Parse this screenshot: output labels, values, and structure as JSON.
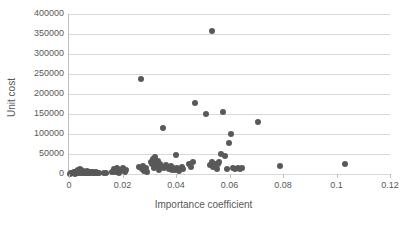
{
  "chart_data": {
    "type": "scatter",
    "title": "",
    "xlabel": "Importance coefficient",
    "ylabel": "Unit cost",
    "xlim": [
      0,
      0.12
    ],
    "ylim": [
      0,
      400000
    ],
    "xticks": [
      "0",
      "0.02",
      "0.04",
      "0.06",
      "0.08",
      "0.1",
      "0.12"
    ],
    "xtick_values": [
      0,
      0.02,
      0.04,
      0.06,
      0.08,
      0.1,
      0.12
    ],
    "yticks": [
      "0",
      "50000",
      "100000",
      "150000",
      "200000",
      "250000",
      "300000",
      "350000",
      "400000"
    ],
    "ytick_values": [
      0,
      50000,
      100000,
      150000,
      200000,
      250000,
      300000,
      350000,
      400000
    ],
    "grid": "horizontal",
    "legend": "none",
    "marker_color": "#595959",
    "gridline_color": "#d9d9d9",
    "axis_color": "#bfbfbf",
    "series": [
      {
        "name": "Items",
        "points": [
          [
            0.0005,
            1000
          ],
          [
            0.0008,
            2500
          ],
          [
            0.0011,
            1500
          ],
          [
            0.0013,
            3000
          ],
          [
            0.0016,
            2000
          ],
          [
            0.0018,
            5000
          ],
          [
            0.0021,
            1000
          ],
          [
            0.0024,
            4000
          ],
          [
            0.0026,
            2500
          ],
          [
            0.0029,
            8000
          ],
          [
            0.0031,
            3500
          ],
          [
            0.0034,
            11000
          ],
          [
            0.0036,
            2000
          ],
          [
            0.0039,
            6000
          ],
          [
            0.0041,
            13000
          ],
          [
            0.0043,
            3000
          ],
          [
            0.0046,
            9000
          ],
          [
            0.0049,
            4500
          ],
          [
            0.0051,
            2000
          ],
          [
            0.0054,
            7000
          ],
          [
            0.0057,
            3000
          ],
          [
            0.006,
            5000
          ],
          [
            0.0063,
            2000
          ],
          [
            0.0066,
            8000
          ],
          [
            0.0069,
            3500
          ],
          [
            0.0072,
            2500
          ],
          [
            0.0076,
            6000
          ],
          [
            0.0079,
            2000
          ],
          [
            0.0082,
            4000
          ],
          [
            0.0086,
            2500
          ],
          [
            0.0089,
            5500
          ],
          [
            0.0093,
            3000
          ],
          [
            0.0096,
            2000
          ],
          [
            0.01,
            4500
          ],
          [
            0.0104,
            2500
          ],
          [
            0.0108,
            3500
          ],
          [
            0.0112,
            2000
          ],
          [
            0.0131,
            3000
          ],
          [
            0.0138,
            2500
          ],
          [
            0.0162,
            6000
          ],
          [
            0.0168,
            12000
          ],
          [
            0.0172,
            4000
          ],
          [
            0.0178,
            14000
          ],
          [
            0.0182,
            7000
          ],
          [
            0.0188,
            3500
          ],
          [
            0.0195,
            9000
          ],
          [
            0.0203,
            16000
          ],
          [
            0.0208,
            5000
          ],
          [
            0.0213,
            11000
          ],
          [
            0.0262,
            17000
          ],
          [
            0.0268,
            237000
          ],
          [
            0.0272,
            12000
          ],
          [
            0.0277,
            21000
          ],
          [
            0.0281,
            8000
          ],
          [
            0.0286,
            15000
          ],
          [
            0.0291,
            5000
          ],
          [
            0.0305,
            30000
          ],
          [
            0.031,
            24000
          ],
          [
            0.0314,
            38000
          ],
          [
            0.0318,
            16000
          ],
          [
            0.0322,
            42000
          ],
          [
            0.0326,
            28000
          ],
          [
            0.033,
            20000
          ],
          [
            0.0334,
            33000
          ],
          [
            0.0338,
            11000
          ],
          [
            0.0342,
            26000
          ],
          [
            0.0346,
            18000
          ],
          [
            0.0352,
            116000
          ],
          [
            0.0356,
            14000
          ],
          [
            0.0361,
            22000
          ],
          [
            0.0375,
            13000
          ],
          [
            0.038,
            20000
          ],
          [
            0.0385,
            9000
          ],
          [
            0.039,
            16000
          ],
          [
            0.0395,
            11000
          ],
          [
            0.04,
            47000
          ],
          [
            0.0405,
            14000
          ],
          [
            0.041,
            7000
          ],
          [
            0.0421,
            17000
          ],
          [
            0.0428,
            12000
          ],
          [
            0.045,
            25000
          ],
          [
            0.0457,
            18000
          ],
          [
            0.0463,
            29000
          ],
          [
            0.047,
            178000
          ],
          [
            0.0512,
            150000
          ],
          [
            0.0528,
            23000
          ],
          [
            0.0533,
            30000
          ],
          [
            0.0535,
            358000
          ],
          [
            0.054,
            17000
          ],
          [
            0.0545,
            26000
          ],
          [
            0.0549,
            20000
          ],
          [
            0.0553,
            13000
          ],
          [
            0.0558,
            24000
          ],
          [
            0.0562,
            31000
          ],
          [
            0.0568,
            49000
          ],
          [
            0.0575,
            154000
          ],
          [
            0.0582,
            46000
          ],
          [
            0.059,
            13000
          ],
          [
            0.0598,
            78000
          ],
          [
            0.0605,
            101000
          ],
          [
            0.0612,
            14000
          ],
          [
            0.062,
            12000
          ],
          [
            0.063,
            15000
          ],
          [
            0.0638,
            13000
          ],
          [
            0.0645,
            14000
          ],
          [
            0.0705,
            129000
          ],
          [
            0.079,
            21000
          ],
          [
            0.1032,
            25000
          ]
        ]
      }
    ]
  }
}
